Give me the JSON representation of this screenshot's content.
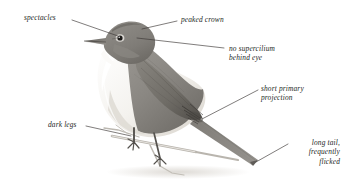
{
  "figure": {
    "kind": "bird-identification-plate",
    "background_color": "#ffffff",
    "ink_color": "#231f1d",
    "leader_line_color": "#3a3634",
    "plumage_colors": {
      "upperparts": "#8d8a86",
      "upperparts_dark": "#6f6c69",
      "crown": "#7e7b77",
      "underparts": "#f2f0ec",
      "throat": "#fbfaf8",
      "flank_wash": "#ddd9d3",
      "wing": "#79766f",
      "wing_tip": "#5d5a55",
      "tail": "#7d7a75",
      "bill": "#6b6864",
      "eye": "#1d1b19",
      "legs": "#55524e",
      "branch": "#b9b5ae",
      "shadow": "#e2dfda"
    }
  },
  "annotations": [
    {
      "id": "spectacles",
      "text": "spectacles",
      "align": "left",
      "text_x": 24,
      "text_y": 13,
      "leader": {
        "x1": 72,
        "y1": 20,
        "x2": 118,
        "y2": 36
      }
    },
    {
      "id": "peaked-crown",
      "text": "peaked crown",
      "align": "left",
      "text_x": 181,
      "text_y": 15,
      "leader": {
        "x1": 177,
        "y1": 21,
        "x2": 142,
        "y2": 29
      }
    },
    {
      "id": "no-supercilium-behind-eye",
      "text": "no supercilium\nbehind eye",
      "align": "left",
      "text_x": 229,
      "text_y": 44,
      "leader": {
        "x1": 224,
        "y1": 48,
        "x2": 137,
        "y2": 38
      }
    },
    {
      "id": "short-primary-projection",
      "text": "short primary\nprojection",
      "align": "left",
      "text_x": 261,
      "text_y": 84,
      "leader": {
        "x1": 258,
        "y1": 90,
        "x2": 202,
        "y2": 119
      }
    },
    {
      "id": "dark-legs",
      "text": "dark legs",
      "align": "left",
      "text_x": 48,
      "text_y": 120,
      "leader": {
        "x1": 86,
        "y1": 126,
        "x2": 131,
        "y2": 136
      }
    },
    {
      "id": "long-tail-frequently-flicked",
      "text": "long tail,\nfrequently\nflicked",
      "align": "right",
      "text_x": 282,
      "text_y": 138,
      "leader": {
        "x1": 288,
        "y1": 144,
        "x2": 256,
        "y2": 162
      }
    }
  ]
}
